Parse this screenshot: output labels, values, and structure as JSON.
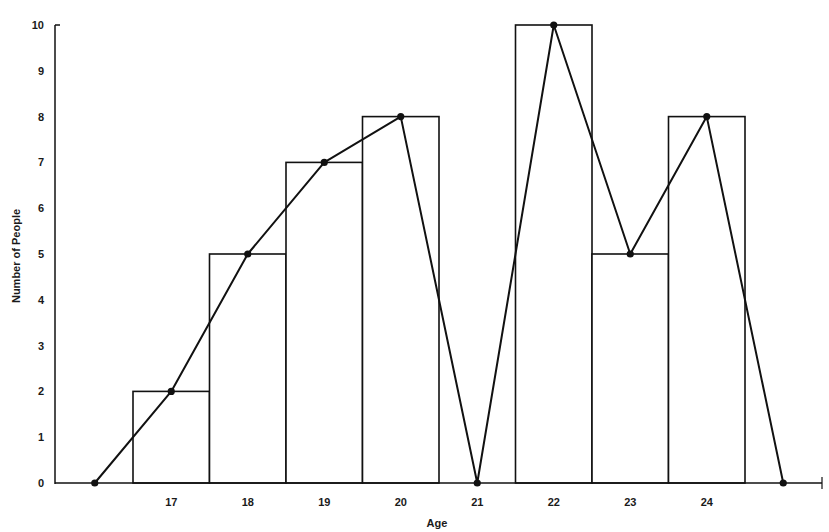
{
  "chart_data": {
    "type": "bar",
    "subtype": "histogram_with_frequency_polygon",
    "title": "",
    "xlabel": "Age",
    "ylabel": "Number of People",
    "categories": [
      "17",
      "18",
      "19",
      "20",
      "21",
      "22",
      "23",
      "24"
    ],
    "values": [
      2,
      5,
      7,
      8,
      0,
      10,
      5,
      8
    ],
    "series": [
      {
        "name": "Histogram",
        "type": "bar",
        "values": [
          2,
          5,
          7,
          8,
          0,
          10,
          5,
          8
        ]
      },
      {
        "name": "Frequency Polygon",
        "type": "line",
        "x": [
          "16",
          "17",
          "18",
          "19",
          "20",
          "21",
          "22",
          "23",
          "24",
          "25"
        ],
        "values": [
          0,
          2,
          5,
          7,
          8,
          0,
          10,
          5,
          8,
          0
        ]
      }
    ],
    "ylim": [
      0,
      10
    ],
    "yticks": [
      "0",
      "1",
      "2",
      "3",
      "4",
      "5",
      "6",
      "7",
      "8",
      "9",
      "10"
    ],
    "xticks": [
      "17",
      "18",
      "19",
      "20",
      "21",
      "22",
      "23",
      "24"
    ],
    "grid": false,
    "legend": null,
    "colors": {
      "line": "#111111",
      "bar_fill": "#ffffff",
      "bar_stroke": "#111111"
    }
  }
}
